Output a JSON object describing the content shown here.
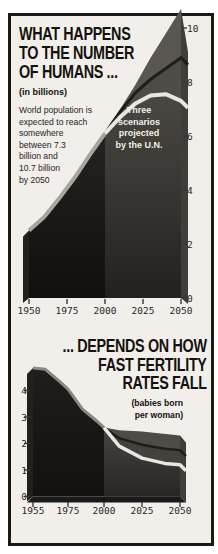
{
  "figure": {
    "top_chart": {
      "title_lines": [
        "WHAT HAPPENS",
        "TO THE NUMBER",
        "OF HUMANS ..."
      ],
      "units_label": "(in billions)",
      "note_lines": [
        "World population is",
        "expected to reach",
        "somewhere",
        "between 7.3",
        "billion and",
        "10.7 billion",
        "by 2050"
      ],
      "annotation_lines": [
        "Three",
        "scenarios",
        "projected",
        "by the U.N."
      ]
    },
    "bottom_chart": {
      "title_lines": [
        "... DEPENDS ON HOW",
        "FAST FERTILITY",
        "RATES FALL"
      ],
      "units_lines": [
        "(babies born",
        "per woman)"
      ]
    }
  },
  "colors": {
    "background": "#f2efea",
    "frame_border": "#1b1815",
    "historical_area": "#171412",
    "projection_low_area": "#312e2b",
    "projection_medium_band": "#4f4c47",
    "projection_high_band": "#5a5650",
    "side_face": "#413e3a",
    "silver_curve": "#a8a49e",
    "white_curve": "#eae7e1",
    "dark_curve": "#201d1a",
    "title_text": "#14110e",
    "annotation_text": "#f2efe9",
    "tick_text": "#2b2724"
  },
  "chart_data": [
    {
      "type": "area",
      "title": "WHAT HAPPENS TO THE NUMBER OF HUMANS ...",
      "subtitle": "(in billions)",
      "note": "World population is expected to reach somewhere between 7.3 billion and 10.7 billion by 2050",
      "annotation": "Three scenarios projected by the U.N.",
      "xlabel": "year",
      "ylabel": "world population (billions)",
      "x_tick_labels": [
        "1950",
        "1975",
        "2000",
        "2025",
        "2050"
      ],
      "y_tick_values": [
        0,
        2,
        4,
        6,
        8,
        10
      ],
      "ylim": [
        0,
        10.7
      ],
      "grid": false,
      "series": [
        {
          "role": "historical",
          "name": "World population 1950-2000",
          "x": [
            1950,
            1960,
            1970,
            1980,
            1990,
            2000
          ],
          "y": [
            2.5,
            3.0,
            3.7,
            4.45,
            5.3,
            6.1
          ]
        },
        {
          "role": "high",
          "name": "U.N. high scenario",
          "x": [
            2000,
            2010,
            2020,
            2030,
            2040,
            2050
          ],
          "y": [
            6.1,
            7.0,
            7.9,
            8.9,
            9.8,
            10.7
          ]
        },
        {
          "role": "medium",
          "name": "U.N. medium scenario",
          "x": [
            2000,
            2010,
            2020,
            2030,
            2040,
            2050
          ],
          "y": [
            6.1,
            6.9,
            7.6,
            8.1,
            8.5,
            8.9
          ]
        },
        {
          "role": "low",
          "name": "U.N. low scenario",
          "x": [
            2000,
            2010,
            2020,
            2030,
            2040,
            2050
          ],
          "y": [
            6.1,
            6.7,
            7.2,
            7.5,
            7.55,
            7.3
          ]
        }
      ],
      "render": {
        "x_years": [
          1950,
          1975,
          2000,
          2025,
          2050
        ],
        "x_px": [
          29,
          67,
          105,
          143,
          181
        ],
        "y_values": [
          0,
          10
        ],
        "y_px": [
          298,
          28
        ],
        "side_dx": 7,
        "side_drop": 43,
        "left_bevel": true,
        "bottom_bevel": false,
        "ticks": {
          "bottom_y": [
            299,
            304
          ],
          "right_x": [
            181.5,
            187
          ]
        },
        "xlabel_top": 305,
        "ylabel_left": 187,
        "fills": {
          "historical": "url(#histGrad0)",
          "low": "url(#projGrad0)",
          "medium": "#4f4c47",
          "high": "#5a5650"
        },
        "hist_stroke": {
          "color": "#a8a49e",
          "w": 4
        },
        "low_stroke": {
          "color": "#eae7e1",
          "w": 4
        },
        "medium_stroke": {
          "color": "#201d1a",
          "w": 3
        }
      }
    },
    {
      "type": "area",
      "title": "... DEPENDS ON HOW FAST FERTILITY RATES FALL",
      "subtitle": "(babies born per woman)",
      "xlabel": "year",
      "ylabel": "total fertility rate (babies born per woman)",
      "x_tick_labels": [
        "1955",
        "1975",
        "2000",
        "2025",
        "2050"
      ],
      "y_tick_values": [
        0,
        1,
        2,
        3,
        4
      ],
      "ylim": [
        0,
        5
      ],
      "grid": false,
      "series": [
        {
          "role": "historical",
          "name": "Fertility rate 1955-2000",
          "x": [
            1955,
            1962,
            1970,
            1975,
            1985,
            1995,
            2000
          ],
          "y": [
            4.85,
            4.8,
            4.35,
            4.05,
            3.3,
            2.85,
            2.6
          ]
        },
        {
          "role": "high",
          "name": "U.N. high scenario",
          "x": [
            2000,
            2010,
            2025,
            2050
          ],
          "y": [
            2.6,
            2.5,
            2.45,
            2.3
          ]
        },
        {
          "role": "medium",
          "name": "U.N. medium scenario",
          "x": [
            2000,
            2010,
            2025,
            2040,
            2050
          ],
          "y": [
            2.6,
            2.2,
            1.95,
            1.8,
            1.75
          ]
        },
        {
          "role": "low",
          "name": "U.N. low scenario",
          "x": [
            2000,
            2010,
            2025,
            2040,
            2050
          ],
          "y": [
            2.6,
            1.9,
            1.45,
            1.25,
            1.2
          ]
        }
      ],
      "render": {
        "x_years": [
          1955,
          1975,
          2000,
          2025,
          2050
        ],
        "x_px": [
          33,
          68,
          104,
          142,
          180
        ],
        "y_values": [
          0,
          5
        ],
        "y_px": [
          496.5,
          364
        ],
        "side_dx": 6,
        "side_drop": 7,
        "left_bevel": true,
        "bottom_bevel": true,
        "ticks": {
          "bottom_y": [
            502,
            507
          ],
          "left_x": [
            24,
            30
          ]
        },
        "xlabel_top": 505,
        "ylabel_left": 9,
        "fills": {
          "historical": "url(#histGrad1)",
          "low": "url(#projGrad1)",
          "medium": "#44413d",
          "high": "#4f4c47"
        },
        "hist_stroke": {
          "color": "#8b8782",
          "w": 3
        },
        "low_stroke": {
          "color": "#eae7e1",
          "w": 3.5
        },
        "medium_stroke": {
          "color": "#201d1a",
          "w": 2.5
        }
      }
    }
  ]
}
